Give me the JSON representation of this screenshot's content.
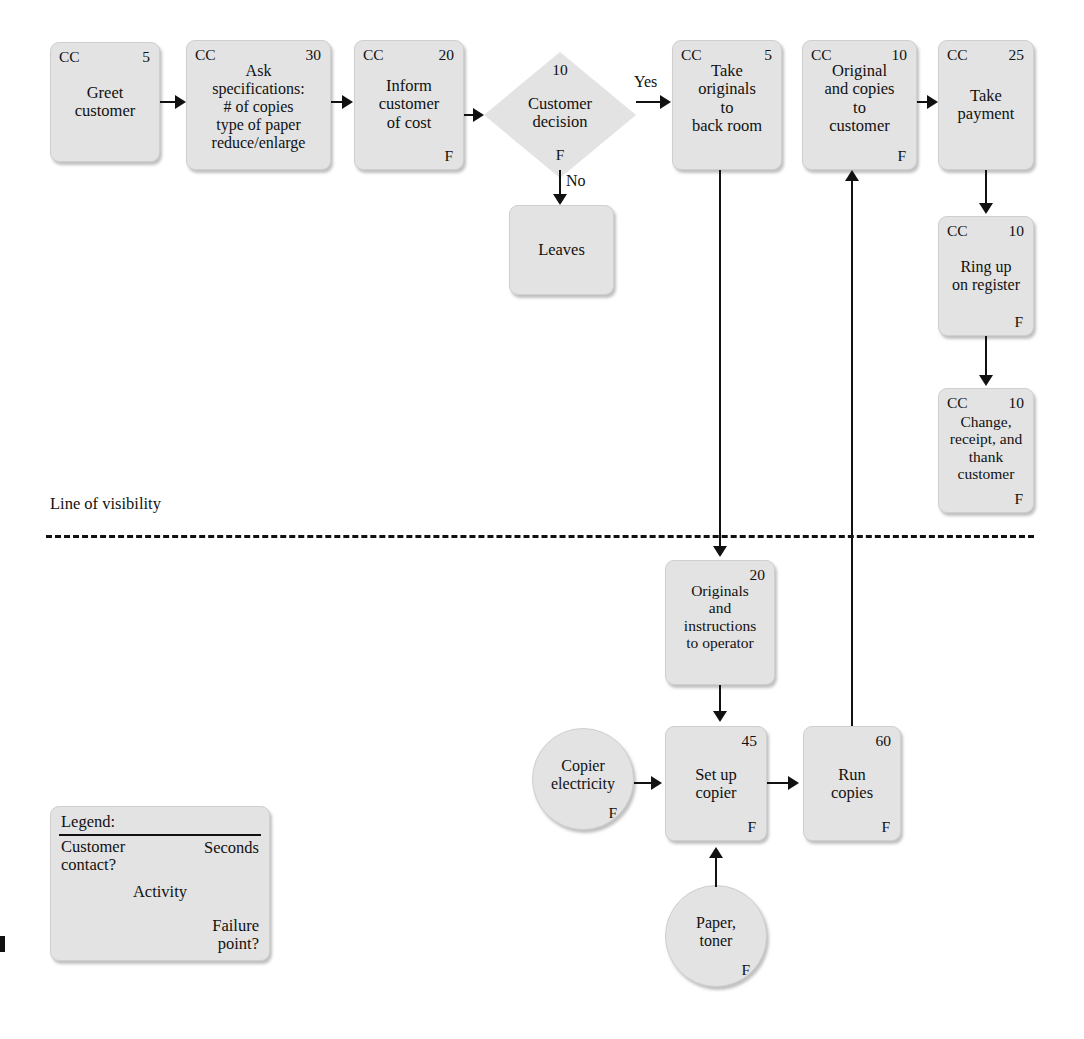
{
  "diagram": {
    "visibility_line_label": "Line of visibility",
    "colors": {
      "node_fill": "#e3e3e3",
      "node_border": "#cfcfcf",
      "line": "#111111",
      "background": "#ffffff"
    }
  },
  "legend": {
    "title": "Legend:",
    "customer_contact": "Customer contact?",
    "seconds": "Seconds",
    "activity": "Activity",
    "failure_point": "Failure point?"
  },
  "nodes": [
    {
      "id": "greet",
      "shape": "box",
      "cc": "CC",
      "seconds": "5",
      "fail": "",
      "body": "Greet\ncustomer"
    },
    {
      "id": "ask_specs",
      "shape": "box",
      "cc": "CC",
      "seconds": "30",
      "fail": "",
      "body": "Ask\nspecifications:\n# of copies\ntype of paper\nreduce/enlarge"
    },
    {
      "id": "inform_cost",
      "shape": "box",
      "cc": "CC",
      "seconds": "20",
      "fail": "F",
      "body": "Inform\ncustomer\nof cost"
    },
    {
      "id": "decision",
      "shape": "diamond",
      "cc": "",
      "seconds": "10",
      "fail": "F",
      "body": "Customer\ndecision"
    },
    {
      "id": "leaves",
      "shape": "box",
      "cc": "",
      "seconds": "",
      "fail": "",
      "body": "Leaves"
    },
    {
      "id": "take_orig",
      "shape": "box",
      "cc": "CC",
      "seconds": "5",
      "fail": "",
      "body": "Take\noriginals\nto\nback room"
    },
    {
      "id": "orig_copies",
      "shape": "box",
      "cc": "CC",
      "seconds": "10",
      "fail": "F",
      "body": "Original\nand copies\nto\ncustomer"
    },
    {
      "id": "take_payment",
      "shape": "box",
      "cc": "CC",
      "seconds": "25",
      "fail": "",
      "body": "Take\npayment"
    },
    {
      "id": "ring_up",
      "shape": "box",
      "cc": "CC",
      "seconds": "10",
      "fail": "F",
      "body": "Ring up\non register"
    },
    {
      "id": "change",
      "shape": "box",
      "cc": "CC",
      "seconds": "10",
      "fail": "F",
      "body": "Change,\nreceipt, and\nthank\ncustomer"
    },
    {
      "id": "orig_instr",
      "shape": "box",
      "cc": "",
      "seconds": "20",
      "fail": "",
      "body": "Originals\nand\ninstructions\nto operator"
    },
    {
      "id": "electricity",
      "shape": "circle",
      "cc": "",
      "seconds": "",
      "fail": "F",
      "body": "Copier\nelectricity"
    },
    {
      "id": "setup",
      "shape": "box",
      "cc": "",
      "seconds": "45",
      "fail": "F",
      "body": "Set up\ncopier"
    },
    {
      "id": "run_copies",
      "shape": "box",
      "cc": "",
      "seconds": "60",
      "fail": "F",
      "body": "Run\ncopies"
    },
    {
      "id": "paper_toner",
      "shape": "circle",
      "cc": "",
      "seconds": "",
      "fail": "F",
      "body": "Paper,\ntoner"
    }
  ],
  "edge_labels": {
    "yes": "Yes",
    "no": "No"
  }
}
